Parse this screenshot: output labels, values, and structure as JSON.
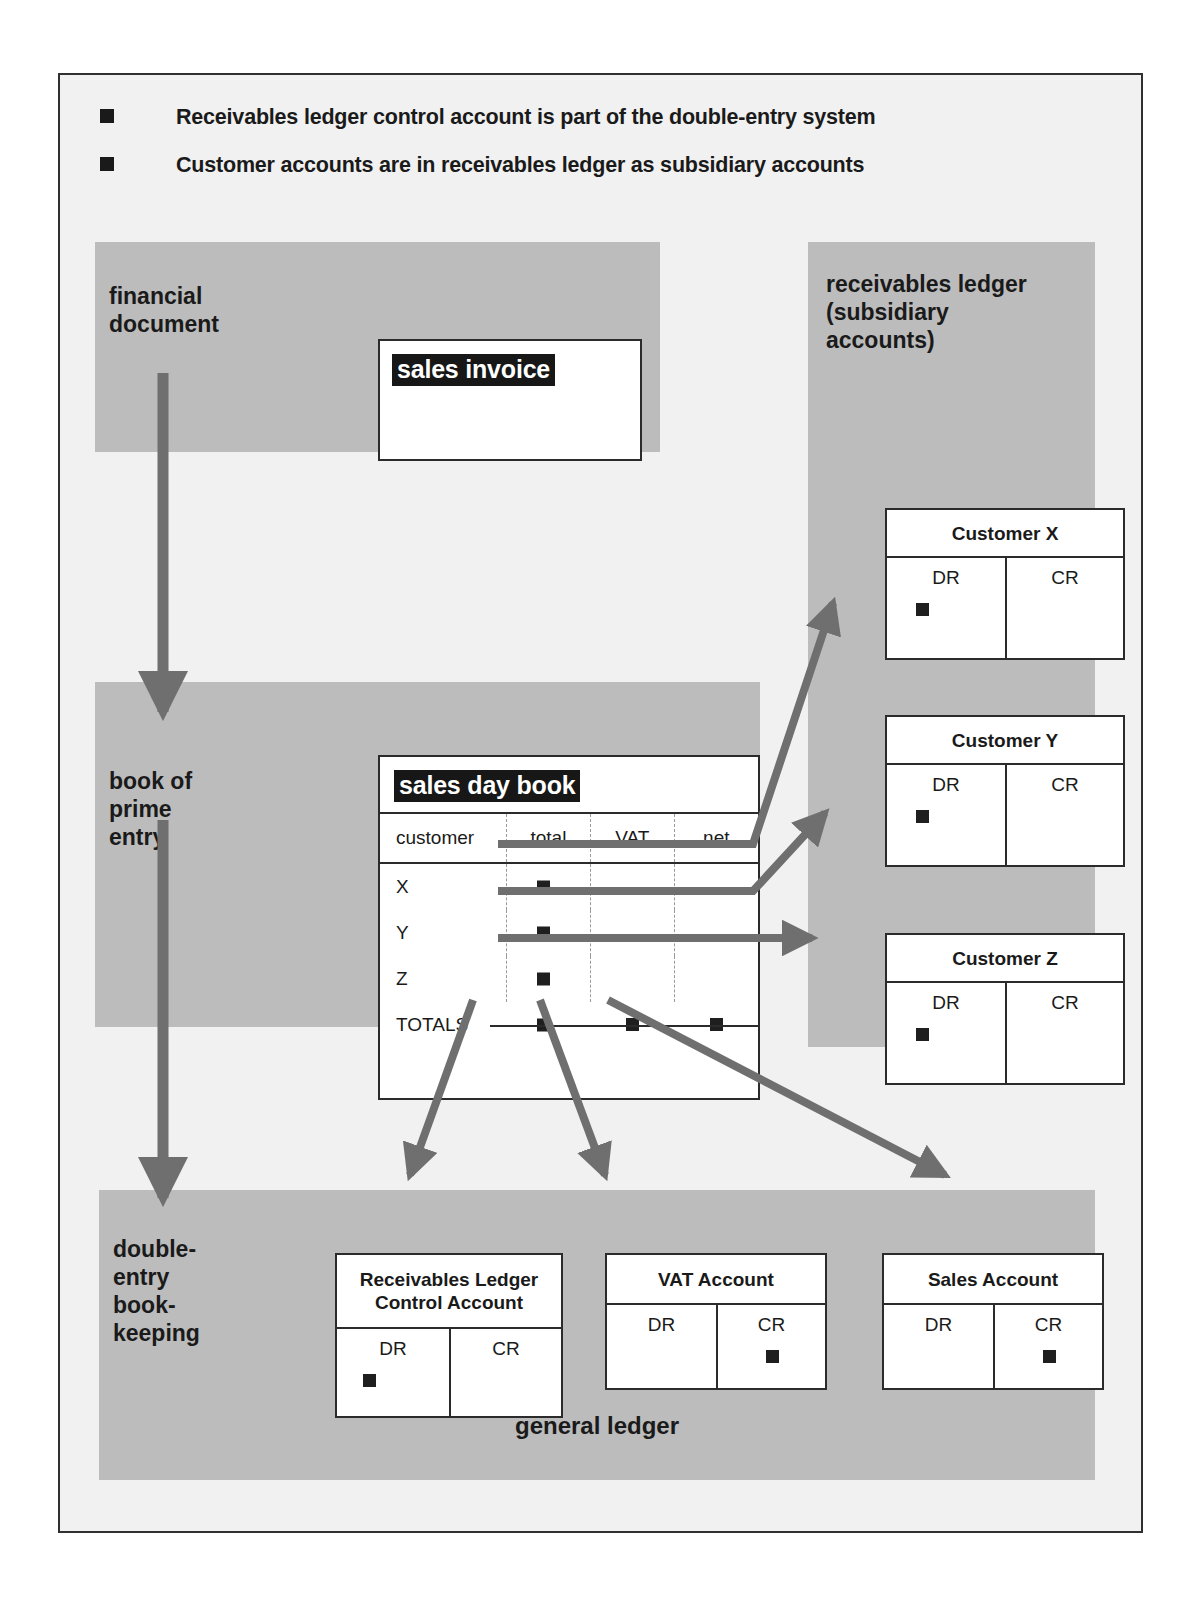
{
  "bullets": [
    {
      "marker": "square-bullet",
      "text": "Receivables ledger control account is part of the double-entry system"
    },
    {
      "marker": "square-bullet",
      "text": "Customer accounts are in receivables ledger as subsidiary accounts"
    }
  ],
  "bands": {
    "financial_document": {
      "label": "financial\ndocument"
    },
    "book_of_prime_entry": {
      "label": "book of\nprime\nentry"
    },
    "receivables_ledger": {
      "label": "receivables ledger\n(subsidiary\naccounts)"
    },
    "double_entry": {
      "label": "double-\nentry\nbook-\nkeeping",
      "footer": "general ledger"
    }
  },
  "sales_invoice": {
    "title": "sales invoice"
  },
  "sales_day_book": {
    "title": "sales day book",
    "columns": [
      "customer",
      "total",
      "VAT",
      "net"
    ],
    "rows": [
      {
        "customer": "X",
        "total": "■",
        "vat": "",
        "net": ""
      },
      {
        "customer": "Y",
        "total": "■",
        "vat": "",
        "net": ""
      },
      {
        "customer": "Z",
        "total": "■",
        "vat": "",
        "net": ""
      }
    ],
    "totals_label": "TOTALS",
    "totals": {
      "total": "■",
      "vat": "■",
      "net": "■"
    }
  },
  "t_accounts": {
    "customer_x": {
      "title": "Customer X",
      "dr": "DR",
      "cr": "CR",
      "entry_side": "DR"
    },
    "customer_y": {
      "title": "Customer Y",
      "dr": "DR",
      "cr": "CR",
      "entry_side": "DR"
    },
    "customer_z": {
      "title": "Customer Z",
      "dr": "DR",
      "cr": "CR",
      "entry_side": "DR"
    },
    "rlca": {
      "title": "Receivables Ledger\nControl Account",
      "dr": "DR",
      "cr": "CR",
      "entry_side": "DR"
    },
    "vat": {
      "title": "VAT Account",
      "dr": "DR",
      "cr": "CR",
      "entry_side": "CR"
    },
    "sales": {
      "title": "Sales Account",
      "dr": "DR",
      "cr": "CR",
      "entry_side": "CR"
    }
  },
  "colors": {
    "band_gray": "#bcbcbc",
    "slide_bg": "#f1f1f1",
    "arrow_gray": "#6f6f6f",
    "ink": "#1a1a1a",
    "highlight_bg": "#171717",
    "highlight_fg": "#ffffff"
  },
  "arrows": [
    {
      "name": "flow-document-to-daybook",
      "from": "financial document",
      "to": "book of prime entry"
    },
    {
      "name": "flow-daybook-to-doubleentry",
      "from": "book of prime entry",
      "to": "double-entry book-keeping"
    },
    {
      "name": "flow-x-to-customer-x",
      "from": "sales day book row X total",
      "to": "Customer X DR"
    },
    {
      "name": "flow-y-to-customer-y",
      "from": "sales day book row Y total",
      "to": "Customer Y DR"
    },
    {
      "name": "flow-z-to-customer-z",
      "from": "sales day book row Z total",
      "to": "Customer Z DR"
    },
    {
      "name": "flow-total-to-rlca",
      "from": "TOTALS total",
      "to": "Receivables Ledger Control Account"
    },
    {
      "name": "flow-vat-to-vat-account",
      "from": "TOTALS VAT",
      "to": "VAT Account"
    },
    {
      "name": "flow-net-to-sales-account",
      "from": "TOTALS net",
      "to": "Sales Account"
    }
  ]
}
